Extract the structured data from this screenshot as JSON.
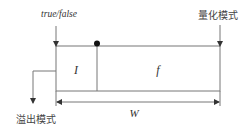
{
  "diagram": {
    "labels": {
      "top_left": "true/false",
      "top_right": "量化模式",
      "bottom_left": "溢出模式",
      "integer_field": "I",
      "fraction_field": "f",
      "width": "W"
    },
    "colors": {
      "line": "#777777",
      "dot": "#111111",
      "background": "#ffffff"
    }
  }
}
